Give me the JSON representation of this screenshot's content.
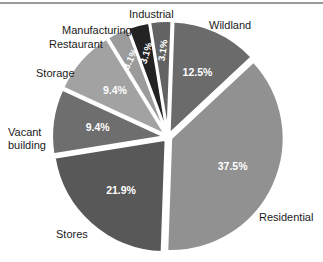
{
  "chart_data": {
    "type": "pie",
    "title": "",
    "subtitle": "",
    "xlabel": "",
    "ylabel": "",
    "legend_position": "outside-labels",
    "grid": false,
    "value_suffix": "%",
    "categories": [
      "Wildland",
      "Residential",
      "Stores",
      "Vacant building",
      "Storage",
      "Restaurant",
      "Manufacturing",
      "Industrial"
    ],
    "values": [
      12.5,
      37.5,
      21.9,
      9.4,
      9.4,
      3.1,
      3.1,
      3.1
    ],
    "slices": [
      {
        "label": "Wildland",
        "value": 12.5,
        "value_text": "12.5%",
        "color": "#6b6b6b",
        "label_x": 209,
        "label_y": 19,
        "pct_rotation": 0
      },
      {
        "label": "Residential",
        "value": 37.5,
        "value_text": "37.5%",
        "color": "#919191",
        "label_x": 259,
        "label_y": 211,
        "pct_rotation": 0
      },
      {
        "label": "Stores",
        "value": 21.9,
        "value_text": "21.9%",
        "color": "#585858",
        "label_x": 56,
        "label_y": 228,
        "pct_rotation": 0
      },
      {
        "label": "Vacant building",
        "value": 9.4,
        "value_text": "9.4%",
        "color": "#6e6e6e",
        "label_x": 8,
        "label_y": 126,
        "pct_rotation": 0
      },
      {
        "label": "Storage",
        "value": 9.4,
        "value_text": "9.4%",
        "color": "#a2a2a2",
        "label_x": 36,
        "label_y": 67,
        "pct_rotation": 0
      },
      {
        "label": "Restaurant",
        "value": 3.1,
        "value_text": "3.1%",
        "color": "#9b9b9b",
        "label_x": 49,
        "label_y": 38,
        "pct_rotation": -64
      },
      {
        "label": "Manufacturing",
        "value": 3.1,
        "value_text": "3.1%",
        "color": "#232323",
        "label_x": 62,
        "label_y": 24,
        "pct_rotation": -74
      },
      {
        "label": "Industrial",
        "value": 3.1,
        "value_text": "3.1%",
        "color": "#636363",
        "label_x": 129,
        "label_y": 8,
        "pct_rotation": -82
      }
    ],
    "colors": {
      "background": "#ffffff",
      "separator": "#ffffff",
      "top_rule": "#9a9a9a",
      "label_text": "#1a1a1a",
      "value_text": "#ffffff"
    }
  }
}
